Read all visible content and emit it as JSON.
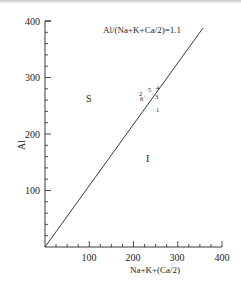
{
  "chart_data": {
    "type": "scatter",
    "title": "",
    "annotation": "Al/(Na+K+Ca/2)=1.1",
    "xlabel": "Na+K+(Ca/2)",
    "ylabel": "Al",
    "xlim": [
      0,
      400
    ],
    "ylim": [
      0,
      400
    ],
    "xticks": [
      "100",
      "200",
      "300",
      "400"
    ],
    "yticks": [
      "100",
      "200",
      "300",
      "400"
    ],
    "grid": false,
    "legend": null,
    "regions": [
      {
        "label": "S",
        "x": 105,
        "y": 268
      },
      {
        "label": "I",
        "x": 238,
        "y": 158
      }
    ],
    "reference_line": {
      "label": "Al/(Na+K+Ca/2)=1.1",
      "from": [
        0,
        0
      ],
      "to": [
        357,
        389
      ]
    },
    "points": [
      {
        "label": "1",
        "x": 248,
        "y": 243
      },
      {
        "label": "2",
        "x": 234,
        "y": 275
      },
      {
        "label": "3",
        "x": 250,
        "y": 270
      },
      {
        "label": "4",
        "x": 252,
        "y": 280
      },
      {
        "label": "5",
        "x": 244,
        "y": 276
      },
      {
        "label": "6",
        "x": 236,
        "y": 267
      }
    ]
  }
}
